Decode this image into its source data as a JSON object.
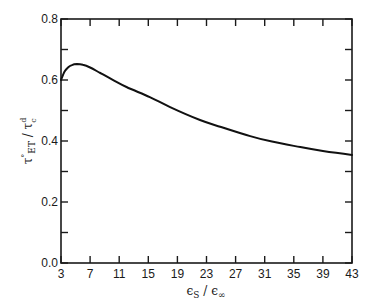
{
  "chart_data": {
    "type": "line",
    "title": "",
    "xlabel": "εS / ε∞",
    "ylabel": "τ°ET / τcd",
    "xlim": [
      3,
      43
    ],
    "ylim": [
      0.0,
      0.8
    ],
    "xticks": [
      3,
      7,
      11,
      15,
      19,
      23,
      27,
      31,
      35,
      39,
      43
    ],
    "yticks": [
      0.0,
      0.1,
      0.2,
      0.3,
      0.4,
      0.5,
      0.6,
      0.7,
      0.8
    ],
    "ytick_labels": [
      "0.0",
      "0.2",
      "0.4",
      "0.6",
      "0.8"
    ],
    "ytick_label_values": [
      0.0,
      0.2,
      0.4,
      0.6,
      0.8
    ],
    "grid": false,
    "legend": null,
    "series": [
      {
        "name": "τ°ET / τcd",
        "x": [
          3.0,
          3.5,
          4.0,
          4.5,
          5.2,
          6.0,
          7.0,
          8.4,
          10.0,
          12.0,
          15.2,
          18.0,
          22.1,
          25.0,
          29.0,
          32.0,
          35.9,
          39.0,
          43.0
        ],
        "y": [
          0.6,
          0.628,
          0.642,
          0.649,
          0.652,
          0.65,
          0.641,
          0.623,
          0.602,
          0.577,
          0.544,
          0.511,
          0.469,
          0.446,
          0.416,
          0.398,
          0.38,
          0.367,
          0.354
        ]
      }
    ]
  },
  "axes": {
    "x_tick_labels": [
      "3",
      "7",
      "11",
      "15",
      "19",
      "23",
      "27",
      "31",
      "35",
      "39",
      "43"
    ],
    "y_tick_labels": [
      "0.0",
      "0.2",
      "0.4",
      "0.6",
      "0.8"
    ]
  }
}
